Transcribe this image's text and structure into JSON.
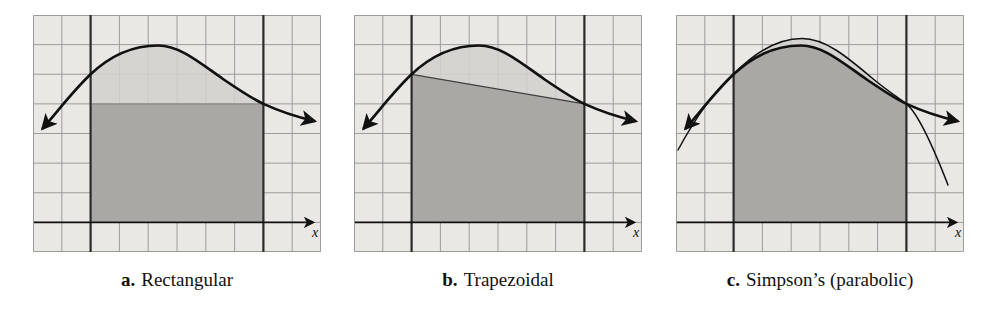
{
  "figure": {
    "axis_label": "x"
  },
  "panels": [
    {
      "id": "a",
      "caption_prefix": "a.",
      "caption": "Rectangular"
    },
    {
      "id": "b",
      "caption_prefix": "b.",
      "caption": "Trapezoidal"
    },
    {
      "id": "c",
      "caption_prefix": "c.",
      "caption": "Simpson’s (parabolic)"
    }
  ],
  "grid": {
    "cols": 10,
    "rows": 8,
    "heavy_col_left": 2,
    "heavy_col_right": 8,
    "axis_row": 7
  },
  "colors": {
    "background": "#ffffff",
    "grid_bg": "#e9e8e4",
    "grid_line": "#949494",
    "heavy_line": "#2b2b2b",
    "ink": "#111111",
    "region_light": "#d2d1cd",
    "region_dark": "#a9a8a4",
    "caption_text": "#111111"
  }
}
